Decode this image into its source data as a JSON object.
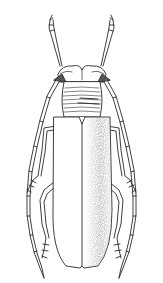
{
  "image": {
    "subject": "longhorn beetle line illustration",
    "background": "#ffffff",
    "ink": "#2a2a2a",
    "stipple": "#6a6a6a"
  }
}
